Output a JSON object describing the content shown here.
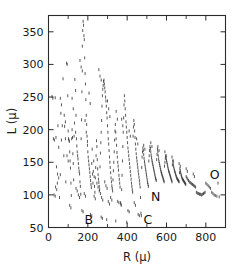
{
  "chart_data": {
    "type": "scatter",
    "title": "",
    "xlabel": "R (μ)",
    "ylabel": "L (μ)",
    "xlim": [
      0,
      900
    ],
    "ylim": [
      50,
      375
    ],
    "grid": false,
    "legend": null,
    "xticks": [
      0,
      200,
      400,
      600,
      800
    ],
    "xtick_labels": [
      "0",
      "200",
      "400",
      "600",
      "800"
    ],
    "xticks_minor": [
      100,
      300,
      500,
      700
    ],
    "yticks": [
      50,
      100,
      150,
      200,
      250,
      300,
      350
    ],
    "ytick_labels": [
      "50",
      "100",
      "150",
      "200",
      "250",
      "300",
      "350"
    ],
    "marker": "vertical-dash",
    "marker_color": "#3a3a3a",
    "annotations": [
      {
        "label": "B",
        "x": 205,
        "y": 62
      },
      {
        "label": "C",
        "x": 505,
        "y": 62
      },
      {
        "label": "N",
        "x": 545,
        "y": 97
      },
      {
        "label": "O",
        "x": 845,
        "y": 131
      }
    ],
    "points": [
      [
        18,
        251
      ],
      [
        22,
        248
      ],
      [
        25,
        186
      ],
      [
        30,
        184
      ],
      [
        34,
        249
      ],
      [
        38,
        188
      ],
      [
        41,
        143
      ],
      [
        45,
        118
      ],
      [
        48,
        206
      ],
      [
        52,
        173
      ],
      [
        56,
        96
      ],
      [
        60,
        131
      ],
      [
        63,
        225
      ],
      [
        66,
        184
      ],
      [
        70,
        206
      ],
      [
        74,
        278
      ],
      [
        78,
        160
      ],
      [
        82,
        205
      ],
      [
        86,
        186
      ],
      [
        88,
        120
      ],
      [
        92,
        302
      ],
      [
        95,
        300
      ],
      [
        98,
        252
      ],
      [
        100,
        198
      ],
      [
        102,
        186
      ],
      [
        104,
        184
      ],
      [
        106,
        182
      ],
      [
        108,
        166
      ],
      [
        110,
        152
      ],
      [
        112,
        141
      ],
      [
        114,
        118
      ],
      [
        116,
        99
      ],
      [
        118,
        186
      ],
      [
        120,
        200
      ],
      [
        122,
        188
      ],
      [
        124,
        163
      ],
      [
        126,
        148
      ],
      [
        128,
        123
      ],
      [
        130,
        190
      ],
      [
        134,
        277
      ],
      [
        138,
        260
      ],
      [
        140,
        222
      ],
      [
        142,
        186
      ],
      [
        144,
        175
      ],
      [
        146,
        166
      ],
      [
        148,
        160
      ],
      [
        150,
        155
      ],
      [
        152,
        148
      ],
      [
        154,
        141
      ],
      [
        156,
        136
      ],
      [
        158,
        132
      ],
      [
        160,
        120
      ],
      [
        162,
        113
      ],
      [
        164,
        101
      ],
      [
        166,
        186
      ],
      [
        168,
        215
      ],
      [
        170,
        258
      ],
      [
        172,
        328
      ],
      [
        174,
        352
      ],
      [
        176,
        366
      ],
      [
        178,
        360
      ],
      [
        180,
        344
      ],
      [
        182,
        338
      ],
      [
        184,
        310
      ],
      [
        186,
        286
      ],
      [
        188,
        270
      ],
      [
        190,
        246
      ],
      [
        192,
        222
      ],
      [
        194,
        208
      ],
      [
        196,
        190
      ],
      [
        198,
        176
      ],
      [
        200,
        166
      ],
      [
        202,
        158
      ],
      [
        204,
        152
      ],
      [
        206,
        146
      ],
      [
        208,
        140
      ],
      [
        210,
        134
      ],
      [
        212,
        128
      ],
      [
        214,
        122
      ],
      [
        216,
        116
      ],
      [
        218,
        111
      ],
      [
        220,
        148
      ],
      [
        222,
        170
      ],
      [
        224,
        132
      ],
      [
        226,
        118
      ],
      [
        228,
        136
      ],
      [
        230,
        152
      ],
      [
        232,
        128
      ],
      [
        234,
        113
      ],
      [
        236,
        104
      ],
      [
        238,
        126
      ],
      [
        240,
        142
      ],
      [
        242,
        160
      ],
      [
        244,
        183
      ],
      [
        246,
        174
      ],
      [
        248,
        154
      ],
      [
        250,
        140
      ],
      [
        252,
        131
      ],
      [
        254,
        124
      ],
      [
        256,
        119
      ],
      [
        258,
        113
      ],
      [
        260,
        108
      ],
      [
        262,
        143
      ],
      [
        264,
        164
      ],
      [
        266,
        180
      ],
      [
        268,
        196
      ],
      [
        270,
        214
      ],
      [
        272,
        236
      ],
      [
        274,
        252
      ],
      [
        276,
        262
      ],
      [
        278,
        268
      ],
      [
        280,
        274
      ],
      [
        282,
        276
      ],
      [
        284,
        270
      ],
      [
        286,
        264
      ],
      [
        288,
        258
      ],
      [
        290,
        250
      ],
      [
        292,
        244
      ],
      [
        294,
        236
      ],
      [
        296,
        226
      ],
      [
        298,
        218
      ],
      [
        300,
        206
      ],
      [
        302,
        196
      ],
      [
        304,
        186
      ],
      [
        306,
        178
      ],
      [
        308,
        168
      ],
      [
        310,
        158
      ],
      [
        312,
        150
      ],
      [
        314,
        142
      ],
      [
        316,
        134
      ],
      [
        318,
        126
      ],
      [
        320,
        120
      ],
      [
        322,
        114
      ],
      [
        324,
        110
      ],
      [
        326,
        106
      ],
      [
        328,
        123
      ],
      [
        330,
        137
      ],
      [
        332,
        150
      ],
      [
        334,
        166
      ],
      [
        336,
        184
      ],
      [
        338,
        198
      ],
      [
        340,
        208
      ],
      [
        342,
        196
      ],
      [
        344,
        186
      ],
      [
        346,
        176
      ],
      [
        348,
        165
      ],
      [
        350,
        158
      ],
      [
        352,
        150
      ],
      [
        354,
        144
      ],
      [
        356,
        138
      ],
      [
        358,
        130
      ],
      [
        360,
        124
      ],
      [
        362,
        118
      ],
      [
        364,
        112
      ],
      [
        366,
        88
      ],
      [
        368,
        86
      ],
      [
        370,
        84
      ],
      [
        372,
        108
      ],
      [
        374,
        130
      ],
      [
        376,
        152
      ],
      [
        378,
        174
      ],
      [
        380,
        196
      ],
      [
        382,
        218
      ],
      [
        384,
        238
      ],
      [
        386,
        252
      ],
      [
        388,
        244
      ],
      [
        390,
        232
      ],
      [
        392,
        222
      ],
      [
        394,
        212
      ],
      [
        396,
        204
      ],
      [
        398,
        196
      ],
      [
        400,
        188
      ],
      [
        402,
        180
      ],
      [
        404,
        172
      ],
      [
        406,
        166
      ],
      [
        408,
        160
      ],
      [
        410,
        154
      ],
      [
        412,
        148
      ],
      [
        414,
        142
      ],
      [
        416,
        136
      ],
      [
        418,
        130
      ],
      [
        420,
        124
      ],
      [
        422,
        118
      ],
      [
        424,
        113
      ],
      [
        426,
        108
      ],
      [
        428,
        104
      ],
      [
        430,
        190
      ],
      [
        432,
        204
      ],
      [
        434,
        214
      ],
      [
        436,
        208
      ],
      [
        438,
        198
      ],
      [
        440,
        188
      ],
      [
        442,
        178
      ],
      [
        444,
        170
      ],
      [
        446,
        163
      ],
      [
        448,
        157
      ],
      [
        450,
        152
      ],
      [
        452,
        147
      ],
      [
        454,
        142
      ],
      [
        456,
        137
      ],
      [
        458,
        132
      ],
      [
        460,
        127
      ],
      [
        462,
        122
      ],
      [
        464,
        117
      ],
      [
        466,
        112
      ],
      [
        468,
        96
      ],
      [
        470,
        72
      ],
      [
        472,
        68
      ],
      [
        474,
        142
      ],
      [
        476,
        158
      ],
      [
        478,
        166
      ],
      [
        480,
        172
      ],
      [
        482,
        168
      ],
      [
        484,
        162
      ],
      [
        486,
        156
      ],
      [
        488,
        151
      ],
      [
        490,
        147
      ],
      [
        492,
        143
      ],
      [
        494,
        139
      ],
      [
        496,
        135
      ],
      [
        498,
        131
      ],
      [
        500,
        127
      ],
      [
        502,
        123
      ],
      [
        504,
        119
      ],
      [
        506,
        116
      ],
      [
        508,
        113
      ],
      [
        510,
        152
      ],
      [
        512,
        160
      ],
      [
        514,
        168
      ],
      [
        516,
        174
      ],
      [
        518,
        171
      ],
      [
        520,
        166
      ],
      [
        522,
        161
      ],
      [
        524,
        157
      ],
      [
        526,
        153
      ],
      [
        528,
        150
      ],
      [
        530,
        147
      ],
      [
        532,
        144
      ],
      [
        534,
        141
      ],
      [
        536,
        138
      ],
      [
        538,
        135
      ],
      [
        540,
        132
      ],
      [
        542,
        129
      ],
      [
        544,
        126
      ],
      [
        546,
        124
      ],
      [
        548,
        122
      ],
      [
        550,
        154
      ],
      [
        552,
        162
      ],
      [
        554,
        170
      ],
      [
        556,
        166
      ],
      [
        558,
        160
      ],
      [
        560,
        155
      ],
      [
        562,
        151
      ],
      [
        564,
        148
      ],
      [
        566,
        145
      ],
      [
        568,
        142
      ],
      [
        570,
        139
      ],
      [
        572,
        136
      ],
      [
        574,
        134
      ],
      [
        576,
        132
      ],
      [
        578,
        130
      ],
      [
        580,
        128
      ],
      [
        582,
        126
      ],
      [
        584,
        124
      ],
      [
        586,
        122
      ],
      [
        588,
        120
      ],
      [
        590,
        144
      ],
      [
        592,
        150
      ],
      [
        594,
        156
      ],
      [
        596,
        160
      ],
      [
        598,
        157
      ],
      [
        600,
        153
      ],
      [
        602,
        150
      ],
      [
        604,
        147
      ],
      [
        606,
        144
      ],
      [
        608,
        141
      ],
      [
        610,
        138
      ],
      [
        612,
        136
      ],
      [
        614,
        134
      ],
      [
        616,
        132
      ],
      [
        618,
        130
      ],
      [
        620,
        128
      ],
      [
        622,
        126
      ],
      [
        624,
        124
      ],
      [
        626,
        122
      ],
      [
        628,
        120
      ],
      [
        630,
        146
      ],
      [
        632,
        152
      ],
      [
        634,
        148
      ],
      [
        636,
        144
      ],
      [
        638,
        141
      ],
      [
        640,
        138
      ],
      [
        642,
        136
      ],
      [
        644,
        134
      ],
      [
        646,
        132
      ],
      [
        648,
        130
      ],
      [
        650,
        128
      ],
      [
        652,
        126
      ],
      [
        654,
        125
      ],
      [
        656,
        124
      ],
      [
        658,
        123
      ],
      [
        660,
        122
      ],
      [
        662,
        121
      ],
      [
        664,
        120
      ],
      [
        666,
        134
      ],
      [
        668,
        140
      ],
      [
        670,
        137
      ],
      [
        672,
        134
      ],
      [
        674,
        131
      ],
      [
        676,
        129
      ],
      [
        678,
        127
      ],
      [
        680,
        125
      ],
      [
        682,
        124
      ],
      [
        684,
        123
      ],
      [
        686,
        122
      ],
      [
        688,
        121
      ],
      [
        690,
        120
      ],
      [
        692,
        119
      ],
      [
        694,
        118
      ],
      [
        696,
        117
      ],
      [
        698,
        116
      ],
      [
        700,
        128
      ],
      [
        704,
        126
      ],
      [
        708,
        124
      ],
      [
        712,
        122
      ],
      [
        716,
        120
      ],
      [
        720,
        119
      ],
      [
        724,
        118
      ],
      [
        728,
        117
      ],
      [
        732,
        116
      ],
      [
        736,
        115
      ],
      [
        740,
        114
      ],
      [
        744,
        113
      ],
      [
        748,
        112
      ],
      [
        752,
        104
      ],
      [
        756,
        103
      ],
      [
        760,
        102
      ],
      [
        764,
        102
      ],
      [
        768,
        101
      ],
      [
        772,
        101
      ],
      [
        776,
        100
      ],
      [
        780,
        100
      ],
      [
        784,
        101
      ],
      [
        788,
        102
      ],
      [
        792,
        103
      ],
      [
        796,
        104
      ],
      [
        800,
        118
      ],
      [
        806,
        116
      ],
      [
        812,
        114
      ],
      [
        818,
        112
      ],
      [
        824,
        110
      ],
      [
        830,
        104
      ],
      [
        836,
        102
      ],
      [
        842,
        100
      ],
      [
        848,
        99
      ],
      [
        856,
        98
      ],
      [
        862,
        118
      ],
      [
        868,
        97
      ],
      [
        120,
        248
      ],
      [
        126,
        232
      ],
      [
        132,
        210
      ],
      [
        138,
        196
      ],
      [
        186,
        214
      ],
      [
        192,
        196
      ],
      [
        198,
        182
      ],
      [
        246,
        118
      ],
      [
        252,
        112
      ],
      [
        258,
        106
      ],
      [
        264,
        102
      ],
      [
        286,
        120
      ],
      [
        292,
        114
      ],
      [
        298,
        110
      ],
      [
        316,
        96
      ],
      [
        322,
        92
      ],
      [
        352,
        90
      ],
      [
        358,
        88
      ],
      [
        404,
        76
      ],
      [
        410,
        74
      ],
      [
        436,
        88
      ],
      [
        442,
        84
      ],
      [
        456,
        70
      ],
      [
        462,
        68
      ],
      [
        108,
        84
      ],
      [
        114,
        80
      ],
      [
        170,
        76
      ],
      [
        176,
        74
      ],
      [
        214,
        70
      ],
      [
        220,
        68
      ],
      [
        268,
        66
      ],
      [
        274,
        64
      ],
      [
        296,
        62
      ],
      [
        342,
        60
      ],
      [
        398,
        58
      ],
      [
        160,
        306
      ],
      [
        166,
        296
      ],
      [
        172,
        290
      ],
      [
        206,
        256
      ],
      [
        212,
        240
      ],
      [
        256,
        292
      ],
      [
        262,
        282
      ],
      [
        268,
        276
      ],
      [
        300,
        244
      ],
      [
        306,
        232
      ],
      [
        312,
        220
      ],
      [
        344,
        228
      ],
      [
        350,
        216
      ],
      [
        372,
        216
      ],
      [
        378,
        206
      ],
      [
        410,
        198
      ],
      [
        416,
        190
      ],
      [
        448,
        186
      ],
      [
        454,
        178
      ],
      [
        484,
        176
      ],
      [
        490,
        170
      ],
      [
        520,
        180
      ],
      [
        526,
        174
      ],
      [
        556,
        174
      ],
      [
        562,
        168
      ],
      [
        592,
        166
      ],
      [
        598,
        160
      ],
      [
        628,
        158
      ],
      [
        634,
        152
      ],
      [
        664,
        148
      ],
      [
        670,
        144
      ],
      [
        700,
        140
      ],
      [
        706,
        136
      ],
      [
        736,
        132
      ],
      [
        742,
        128
      ],
      [
        60,
        248
      ],
      [
        66,
        238
      ],
      [
        80,
        222
      ],
      [
        86,
        212
      ],
      [
        94,
        160
      ],
      [
        100,
        152
      ],
      [
        46,
        132
      ],
      [
        52,
        126
      ],
      [
        36,
        112
      ],
      [
        42,
        108
      ],
      [
        28,
        100
      ],
      [
        34,
        98
      ],
      [
        140,
        110
      ],
      [
        146,
        106
      ],
      [
        152,
        100
      ],
      [
        158,
        96
      ],
      [
        182,
        102
      ],
      [
        188,
        98
      ],
      [
        232,
        98
      ],
      [
        238,
        94
      ],
      [
        270,
        96
      ],
      [
        276,
        92
      ],
      [
        304,
        90
      ],
      [
        310,
        86
      ]
    ]
  }
}
